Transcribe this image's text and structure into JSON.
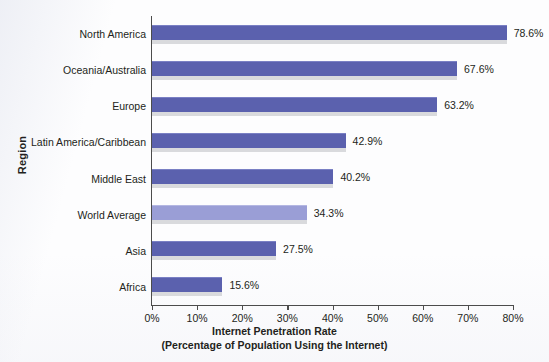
{
  "chart_data": {
    "type": "bar",
    "orientation": "horizontal",
    "title": "",
    "xlabel": "Internet Penetration Rate",
    "xlabel_sub": "(Percentage of Population Using the Internet)",
    "ylabel": "Region",
    "xlim": [
      0,
      80
    ],
    "grid": false,
    "legend": "none",
    "xtick_labels": [
      "0%",
      "10%",
      "20%",
      "30%",
      "40%",
      "50%",
      "60%",
      "70%",
      "80%"
    ],
    "xtick_values": [
      0,
      10,
      20,
      30,
      40,
      50,
      60,
      70,
      80
    ],
    "categories": [
      "North America",
      "Oceania/Australia",
      "Europe",
      "Latin America/Caribbean",
      "Middle East",
      "World Average",
      "Asia",
      "Africa"
    ],
    "values": [
      78.6,
      67.6,
      63.2,
      42.9,
      40.2,
      34.3,
      27.5,
      15.6
    ],
    "value_labels": [
      "78.6%",
      "67.6%",
      "63.2%",
      "42.9%",
      "40.2%",
      "34.3%",
      "27.5%",
      "15.6%"
    ],
    "highlight_index": 5,
    "colors": {
      "bar": "#5b61ae",
      "bar_highlight": "#9a9ed6",
      "bar_shadow": "#d9dadd",
      "axis": "#4c4c4c",
      "text": "#231f20",
      "background": "#fdfdfe"
    }
  }
}
